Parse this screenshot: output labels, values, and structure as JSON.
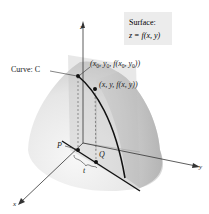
{
  "figure": {
    "surface_label": {
      "title": "Surface:",
      "equation": "z = f(x, y)"
    },
    "curve_label": "Curve: C",
    "axes": {
      "x": "x",
      "y": "y",
      "z": "z"
    },
    "points": {
      "start_point": {
        "prefix": "(x",
        "sub0a": "0",
        "mid1": ", y",
        "sub0b": "0",
        "mid2": ", f(x",
        "sub0c": "0",
        "mid3": ", y",
        "sub0d": "0",
        "suffix": "))"
      },
      "general_point": "(x, y, f(x, y))",
      "P": "P",
      "Q": "Q"
    },
    "parameter_label": "t",
    "colors": {
      "surface_fill": "#d9d9d9",
      "plane_fill": "#bdbdbd",
      "curve": "#111111",
      "axis": "#333333",
      "label_box": "#ececec"
    }
  }
}
